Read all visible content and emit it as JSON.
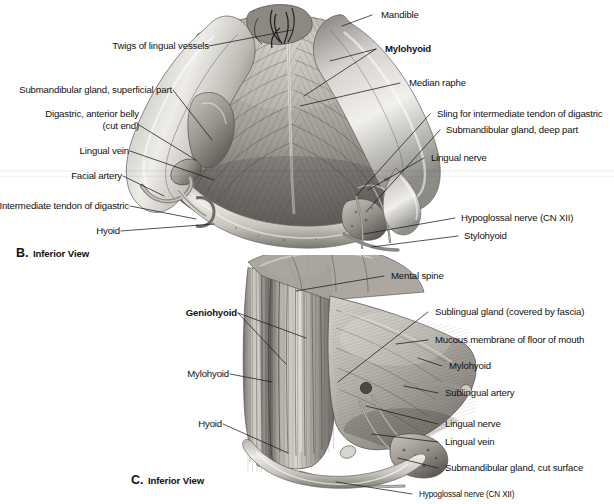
{
  "figure": {
    "background_color": "#ffffff",
    "ink_color": "#111111",
    "panels": [
      {
        "id": "B",
        "caption_letter": "B.",
        "caption_text": "Inferior View",
        "labels_left": [
          {
            "text": "Twigs of lingual vessels",
            "bold": false
          },
          {
            "text": "Submandibular gland, superficial part",
            "bold": false
          },
          {
            "text": "Digastric, anterior belly",
            "bold": false
          },
          {
            "text": "(cut end)",
            "bold": false
          },
          {
            "text": "Lingual vein",
            "bold": false
          },
          {
            "text": "Facial artery",
            "bold": false
          },
          {
            "text": "Intermediate tendon of digastric",
            "bold": false
          },
          {
            "text": "Hyoid",
            "bold": false
          }
        ],
        "labels_right": [
          {
            "text": "Mandible",
            "bold": false
          },
          {
            "text": "Mylohyoid",
            "bold": true
          },
          {
            "text": "Median raphe",
            "bold": false
          },
          {
            "text": "Sling for intermediate tendon of digastric",
            "bold": false
          },
          {
            "text": "Submandibular gland, deep part",
            "bold": false
          },
          {
            "text": "Lingual nerve",
            "bold": false
          },
          {
            "text": "Hypoglossal nerve (CN XII)",
            "bold": false
          },
          {
            "text": "Stylohyoid",
            "bold": false
          }
        ]
      },
      {
        "id": "C",
        "caption_letter": "C.",
        "caption_text": "Inferior View",
        "labels_left": [
          {
            "text": "Geniohyoid",
            "bold": true
          },
          {
            "text": "Mylohyoid",
            "bold": false
          },
          {
            "text": "Hyoid",
            "bold": false
          }
        ],
        "labels_right": [
          {
            "text": "Mental spine",
            "bold": false
          },
          {
            "text": "Sublingual gland (covered by fascia)",
            "bold": false
          },
          {
            "text": "Mucous membrane of floor of mouth",
            "bold": false
          },
          {
            "text": "Mylohyoid",
            "bold": false
          },
          {
            "text": "Sublingual artery",
            "bold": false
          },
          {
            "text": "Lingual nerve",
            "bold": false
          },
          {
            "text": "Lingual vein",
            "bold": false
          },
          {
            "text": "Submandibular gland, cut surface",
            "bold": false
          },
          {
            "text": "Hypoglossal nerve (CN XII)",
            "bold": false
          }
        ]
      }
    ]
  }
}
